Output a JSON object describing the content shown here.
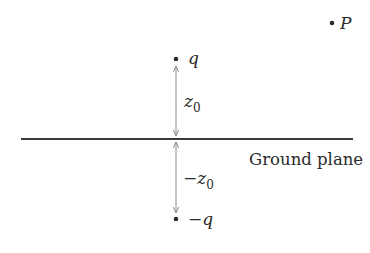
{
  "figure": {
    "type": "image-charge-diagram",
    "ground_plane": {
      "label": "Ground plane"
    },
    "charges": [
      {
        "id": "positive",
        "label": "q"
      },
      {
        "id": "negative",
        "label": "−q"
      }
    ],
    "distances": [
      {
        "id": "above",
        "label": "z",
        "subscript": "0"
      },
      {
        "id": "below",
        "label": "−z",
        "subscript": "0"
      }
    ],
    "point": {
      "label": "P"
    },
    "colors": {
      "line": "#3a3a3a",
      "arrow": "#8a8a8a",
      "dot": "#2a2a2a",
      "text": "#2a2a2a"
    }
  }
}
